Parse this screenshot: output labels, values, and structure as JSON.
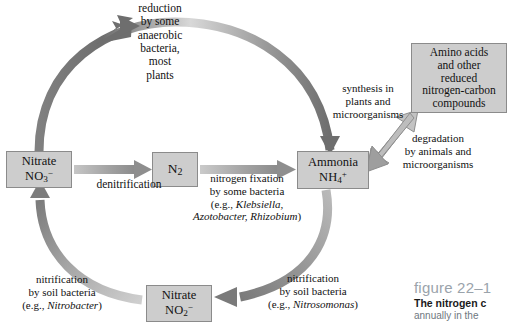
{
  "figure": {
    "type": "diagram",
    "caption": {
      "figure_number": "figure 22–1",
      "title": "The nitrogen c",
      "body": "annually in the"
    }
  },
  "nodes": [
    {
      "id": "nitrate-no3",
      "name": "nitrate-box",
      "line1": "Nitrate",
      "line2_formula": "NO",
      "line2_sub": "3",
      "line2_charge": "−",
      "label_full": "Nitrate NO3−"
    },
    {
      "id": "n2",
      "name": "n2-box",
      "line1": "N",
      "line1_sub": "2",
      "label_full": "N2"
    },
    {
      "id": "ammonia",
      "name": "ammonia-box",
      "line1": "Ammonia",
      "line2_formula": "NH",
      "line2_sub": "4",
      "line2_charge": "+",
      "label_full": "Ammonia NH4+"
    },
    {
      "id": "nitrate-no2",
      "name": "nitrite-box",
      "line1": "Nitrate",
      "line2_formula": "NO",
      "line2_sub": "2",
      "line2_charge": "−",
      "label_full": "Nitrate NO2−"
    },
    {
      "id": "amino-acids",
      "name": "amino-acids-box",
      "lines": [
        "Amino acids",
        "and other",
        "reduced",
        "nitrogen-carbon",
        "compounds"
      ]
    }
  ],
  "process_labels": {
    "reduction": {
      "lines": [
        "reduction",
        "by some",
        "anaerobic",
        "bacteria,",
        "most",
        "plants"
      ]
    },
    "denitrification": {
      "lines": [
        "denitrification"
      ]
    },
    "nitrogen_fixation": {
      "lines": [
        "nitrogen fixation",
        "by some bacteria",
        "(e.g., ",
        ""
      ],
      "line1": "nitrogen fixation",
      "line2": "by some bacteria",
      "line3_pre": "(e.g., ",
      "line3_italic": "Klebsiella,",
      "line4_italic": "Azotobacter, Rhizobium",
      "line4_post": ")"
    },
    "synthesis": {
      "lines": [
        "synthesis in",
        "plants and",
        "microorganisms"
      ]
    },
    "degradation": {
      "lines": [
        "degradation",
        "by animals and",
        "microorganisms"
      ]
    },
    "nitrification_left": {
      "line1": "nitrification",
      "line2": "by soil bacteria",
      "line3_pre": "(e.g., ",
      "line3_italic": "Nitrobacter",
      "line3_post": ")"
    },
    "nitrification_right": {
      "line1": "nitrification",
      "line2": "by soil bacteria",
      "line3_pre": "(e.g., ",
      "line3_italic": "Nitrosomonas",
      "line3_post": ")"
    }
  },
  "colors": {
    "box_fill": "#cdcdcd",
    "box_border": "#8b8b8b",
    "arrow_dark": "#6e6e6e",
    "arrow_mid": "#9a9a9a",
    "arrow_light": "#c9c9c9",
    "text": "#111111",
    "caption_gray": "#9aa3ab",
    "caption_body": "#6f7780"
  }
}
